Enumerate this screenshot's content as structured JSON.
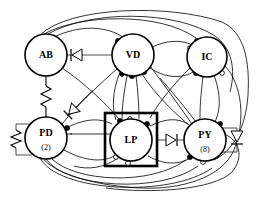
{
  "diagram": {
    "type": "neural-circuit-graph",
    "background_color": "#ffffff",
    "line_color": "#000000",
    "nodes": [
      {
        "id": "AB",
        "label": "AB",
        "sublabel": "",
        "cx": 46,
        "cy": 55,
        "r": 21
      },
      {
        "id": "VD",
        "label": "VD",
        "sublabel": "",
        "cx": 133,
        "cy": 55,
        "r": 21
      },
      {
        "id": "IC",
        "label": "IC",
        "sublabel": "",
        "cx": 207,
        "cy": 57,
        "r": 20
      },
      {
        "id": "PD",
        "label": "PD",
        "sublabel": "(2)",
        "cx": 46,
        "cy": 138,
        "r": 21
      },
      {
        "id": "LP",
        "label": "LP",
        "sublabel": "",
        "cx": 131,
        "cy": 140,
        "r": 21
      },
      {
        "id": "PY",
        "label": "PY",
        "sublabel": "(8)",
        "cx": 205,
        "cy": 140,
        "r": 21
      }
    ],
    "box": {
      "name": "lp-highlight-box",
      "x": 105,
      "y": 113,
      "width": 52,
      "height": 53
    },
    "terminal_types": {
      "filled_circle": "inhibitory chemical synapse",
      "open_circle": "modulatory / graded synapse",
      "triangle": "diode (rectifying electrical junction)",
      "zigzag": "resistor (electrical gap junction)"
    },
    "components": [
      {
        "name": "resistor-ab-pd",
        "kind": "resistor",
        "from": "AB",
        "to": "PD",
        "orientation": "vertical"
      },
      {
        "name": "resistor-pd-self",
        "kind": "resistor",
        "from": "PD",
        "to": "PD",
        "orientation": "vertical-loop-left"
      },
      {
        "name": "diode-ab-vd",
        "kind": "diode",
        "from": "VD",
        "to": "AB",
        "direction": "left"
      },
      {
        "name": "diode-pd-vd",
        "kind": "diode",
        "from": "PD",
        "to": "VD",
        "direction": "upper-right"
      },
      {
        "name": "diode-lp-py",
        "kind": "diode",
        "from": "LP",
        "to": "PY",
        "direction": "right"
      },
      {
        "name": "diode-py-self",
        "kind": "diode",
        "from": "PY",
        "to": "PY",
        "direction": "down-loop-right"
      }
    ]
  }
}
